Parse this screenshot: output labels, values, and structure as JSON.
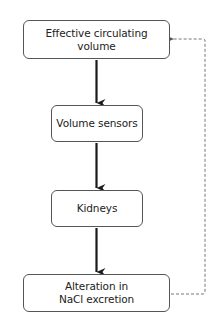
{
  "diagram": {
    "nodes": [
      {
        "id": "effective-circulating-volume",
        "label": "Effective circulating\nvolume"
      },
      {
        "id": "volume-sensors",
        "label": "Volume sensors"
      },
      {
        "id": "kidneys",
        "label": "Kidneys"
      },
      {
        "id": "alteration-nacl-excretion",
        "label": "Alteration in\nNaCl excretion"
      }
    ],
    "edges": [
      {
        "from": "effective-circulating-volume",
        "to": "volume-sensors",
        "style": "solid"
      },
      {
        "from": "volume-sensors",
        "to": "kidneys",
        "style": "solid"
      },
      {
        "from": "kidneys",
        "to": "alteration-nacl-excretion",
        "style": "solid"
      },
      {
        "from": "alteration-nacl-excretion",
        "to": "effective-circulating-volume",
        "style": "dashed",
        "meaning": "feedback"
      }
    ],
    "colors": {
      "line": "#1a1a1a",
      "dashed": "#777777",
      "border": "#555555",
      "text": "#222222"
    }
  }
}
